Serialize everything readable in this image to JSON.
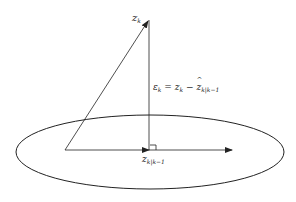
{
  "diagram": {
    "type": "vector-projection",
    "labels": {
      "zk": {
        "main": "z",
        "sub": "k"
      },
      "error": {
        "lhs_main": "ε",
        "lhs_sub": "k",
        "eq": " = ",
        "z_main": "z",
        "z_sub": "k",
        "minus": " − ",
        "hat_main": "z",
        "hat_sub": "k|k−1"
      },
      "estimate": {
        "main": "z",
        "sub": "k|k−1"
      }
    },
    "colors": {
      "stroke": "#222222",
      "background": "#ffffff"
    }
  }
}
